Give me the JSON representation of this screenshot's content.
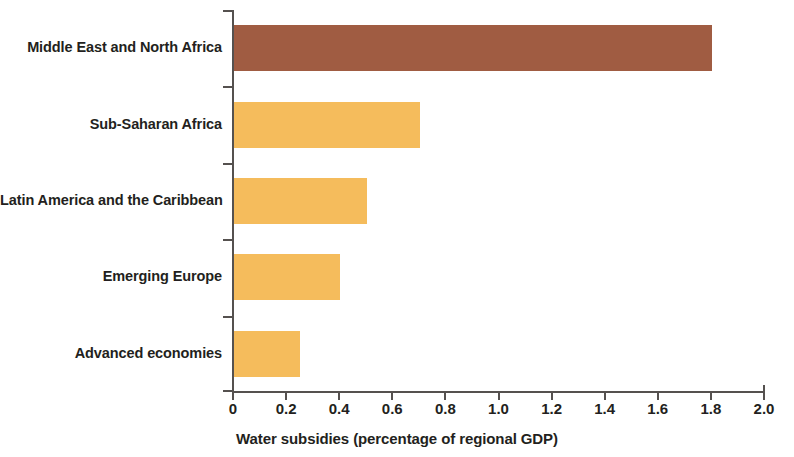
{
  "chart_data": {
    "type": "bar",
    "orientation": "horizontal",
    "title": "",
    "xlabel": "Water subsidies (percentage of regional GDP)",
    "ylabel": "",
    "xlim": [
      0,
      2.0
    ],
    "xticks": [
      "0",
      "0.2",
      "0.4",
      "0.6",
      "0.8",
      "1.0",
      "1.2",
      "1.4",
      "1.6",
      "1.8",
      "2.0"
    ],
    "xtick_values": [
      0,
      0.2,
      0.4,
      0.6,
      0.8,
      1.0,
      1.2,
      1.4,
      1.6,
      1.8,
      2.0
    ],
    "grid": false,
    "legend": "none",
    "categories": [
      "Middle East and North Africa",
      "Sub-Saharan Africa",
      "Latin America and the Caribbean",
      "Emerging Europe",
      "Advanced economies"
    ],
    "values": [
      1.8,
      0.7,
      0.5,
      0.4,
      0.25
    ],
    "bar_colors": [
      "#a05c42",
      "#f5bc5c",
      "#f5bc5c",
      "#f5bc5c",
      "#f5bc5c"
    ],
    "colors": {
      "highlight": "#a05c42",
      "default": "#f5bc5c",
      "axis": "#55514f",
      "text": "#231f20",
      "background": "#ffffff"
    }
  }
}
